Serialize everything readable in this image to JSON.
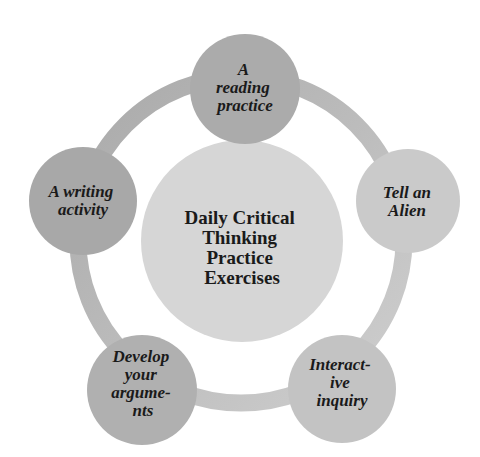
{
  "diagram": {
    "type": "cycle",
    "center": {
      "label_lines": [
        "Daily Critical",
        "Thinking",
        "Practice",
        "Exercises"
      ],
      "color": "#d6d6d6"
    },
    "ring_colors": {
      "dark": "#a9a9a9",
      "light": "#cfcfcf"
    },
    "nodes": [
      {
        "id": "reading",
        "label_lines": [
          "A",
          "reading",
          "practice"
        ],
        "color": "#ababab"
      },
      {
        "id": "alien",
        "label_lines": [
          "Tell an",
          "Alien"
        ],
        "color": "#cacaca"
      },
      {
        "id": "inquiry",
        "label_lines": [
          "Interact-",
          "ive",
          "inquiry"
        ],
        "color": "#c3c3c3"
      },
      {
        "id": "arguments",
        "label_lines": [
          "Develop",
          "your",
          "argume-",
          "nts"
        ],
        "color": "#b0b0b0"
      },
      {
        "id": "writing",
        "label_lines": [
          "A writing",
          "activity"
        ],
        "color": "#a8a8a8"
      }
    ]
  }
}
